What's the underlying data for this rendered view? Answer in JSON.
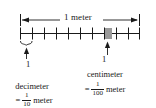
{
  "figure": {
    "title_text": "1 meter",
    "ruler": {
      "total_segments": 10,
      "segment_unit": "decimeter",
      "highlighted_unit": "centimeter",
      "highlight_segment_index": 7,
      "highlight_subdivision_start": 0,
      "highlight_subdivision_end": 1,
      "left_edge_x": 20,
      "right_edge_x": 140,
      "baseline_y": 33,
      "tick_half_height": 6,
      "highlight_color": "#9a9a9a",
      "line_color": "#1a1a1a"
    },
    "arrow": {
      "label": "1 meter",
      "left_x": 20,
      "right_x": 140,
      "y": 20
    },
    "left_callout": {
      "value": "1",
      "unit": "decimeter",
      "equals_sign": "=",
      "fraction_numerator": "1",
      "fraction_denominator": "10",
      "fraction_unit": "meter"
    },
    "right_callout": {
      "value": "1",
      "unit": "centimeter",
      "equals_sign": "=",
      "fraction_numerator": "1",
      "fraction_denominator": "100",
      "fraction_unit": "meter"
    }
  }
}
